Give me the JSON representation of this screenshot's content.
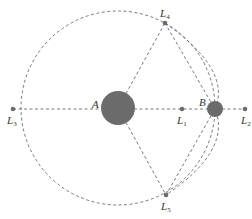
{
  "diagram": {
    "colors": {
      "body": "#6b6b6b",
      "point": "#6b6b6b",
      "dash": "#555555",
      "text": "#333333"
    },
    "bodies": [
      {
        "id": "A",
        "label": "A",
        "cx": 118,
        "cy": 108,
        "r": 17
      },
      {
        "id": "B",
        "label": "B",
        "cx": 215,
        "cy": 109,
        "r": 8
      }
    ],
    "points": [
      {
        "id": "L1",
        "main": "L",
        "sub": "1",
        "cx": 182,
        "cy": 109
      },
      {
        "id": "L2",
        "main": "L",
        "sub": "2",
        "cx": 245,
        "cy": 109
      },
      {
        "id": "L3",
        "main": "L",
        "sub": "3",
        "cx": 13,
        "cy": 109
      },
      {
        "id": "L4",
        "main": "L",
        "sub": "4",
        "cx": 165,
        "cy": 23
      },
      {
        "id": "L5",
        "main": "L",
        "sub": "5",
        "cx": 166,
        "cy": 195
      }
    ],
    "labels": {
      "A": "A",
      "B": "B",
      "L": "L",
      "L1_sub": "1",
      "L2_sub": "2",
      "L3_sub": "3",
      "L4_sub": "4",
      "L5_sub": "5"
    }
  }
}
